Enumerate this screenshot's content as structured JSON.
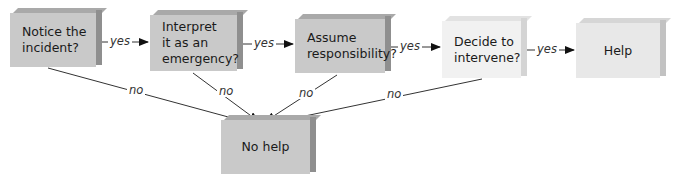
{
  "diagram": {
    "type": "flowchart",
    "nodes": [
      {
        "id": "notice",
        "label": "Notice the\nincident?"
      },
      {
        "id": "interpret",
        "label": "Interpret\nit as an\nemergency?"
      },
      {
        "id": "assume",
        "label": "Assume\nresponsibility?"
      },
      {
        "id": "decide",
        "label": "Decide to\nintervene?"
      },
      {
        "id": "help",
        "label": "Help"
      },
      {
        "id": "nohelp",
        "label": "No help"
      }
    ],
    "edges": [
      {
        "from": "notice",
        "to": "interpret",
        "label": "yes"
      },
      {
        "from": "interpret",
        "to": "assume",
        "label": "yes"
      },
      {
        "from": "assume",
        "to": "decide",
        "label": "yes"
      },
      {
        "from": "decide",
        "to": "help",
        "label": "yes"
      },
      {
        "from": "notice",
        "to": "nohelp",
        "label": "no"
      },
      {
        "from": "interpret",
        "to": "nohelp",
        "label": "no"
      },
      {
        "from": "assume",
        "to": "nohelp",
        "label": "no"
      },
      {
        "from": "decide",
        "to": "nohelp",
        "label": "no"
      }
    ],
    "colors": {
      "box_dark": "#c9c9c9",
      "box_light": "#f1f1f1",
      "line": "#333333"
    }
  }
}
